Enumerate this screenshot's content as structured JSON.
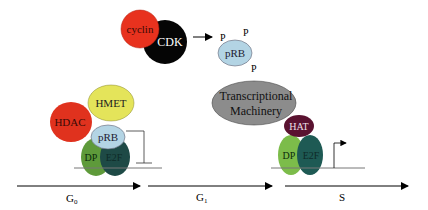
{
  "diagram": {
    "nodes": {
      "cyclin": {
        "label": "cyclin",
        "color": "#e8321e"
      },
      "cdk": {
        "label": "CDK",
        "color": "#050505"
      },
      "prb_phos": {
        "label": "pRB",
        "color": "#b3d4e4"
      },
      "phospho": [
        "P",
        "P",
        "P"
      ],
      "hmet": {
        "label": "HMET",
        "color": "#e4e45a"
      },
      "hdac": {
        "label": "HDAC",
        "color": "#e0321e"
      },
      "prb_bound": {
        "label": "pRB",
        "color": "#b3d4e4"
      },
      "dp_left": {
        "label": "DP",
        "color": "#5e9a3a"
      },
      "e2f_left": {
        "label": "E2F",
        "color": "#1e4a46"
      },
      "transcriptional_machinery": {
        "label_line1": "Transcriptional",
        "label_line2": "Machinery",
        "color": "#8c8c8c"
      },
      "hat": {
        "label": "HAT",
        "color": "#5a1230"
      },
      "dp_right": {
        "label": "DP",
        "color": "#7cbc4a"
      },
      "e2f_right": {
        "label": "E2F",
        "color": "#1e5a54"
      }
    },
    "phases": {
      "g0": {
        "label": "G",
        "sub": "0"
      },
      "g1": {
        "label": "G",
        "sub": "1"
      },
      "s": {
        "label": "S"
      }
    }
  }
}
